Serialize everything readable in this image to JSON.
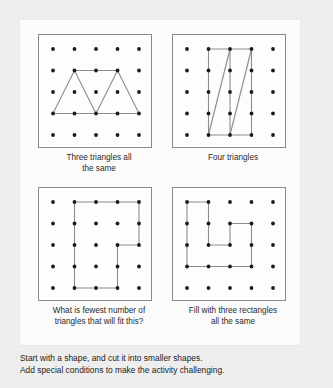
{
  "document": {
    "title": "Geoboard shape activities"
  },
  "grid": {
    "rows": 5,
    "cols": 5,
    "dot_color": "#1b1b1b",
    "line_color": "#8d8d8d",
    "board_border_color": "#8a8a8a"
  },
  "boards": [
    {
      "id": "board-three-triangles",
      "caption": "Three triangles all the same",
      "caption_lines": [
        "Three triangles all",
        "the same"
      ],
      "shape_type": "triangles",
      "polylines": [
        [
          [
            1,
            4
          ],
          [
            2,
            2
          ],
          [
            3,
            4
          ],
          [
            4,
            2
          ],
          [
            5,
            4
          ],
          [
            1,
            4
          ]
        ],
        [
          [
            2,
            2
          ],
          [
            4,
            2
          ]
        ]
      ]
    },
    {
      "id": "board-four-triangles",
      "caption": "Four triangles",
      "caption_lines": [
        "Four triangles"
      ],
      "shape_type": "triangles",
      "polylines": [
        [
          [
            2,
            1
          ],
          [
            4,
            1
          ]
        ],
        [
          [
            2,
            5
          ],
          [
            4,
            5
          ]
        ],
        [
          [
            2,
            1
          ],
          [
            2,
            5
          ]
        ],
        [
          [
            3,
            1
          ],
          [
            3,
            5
          ]
        ],
        [
          [
            4,
            1
          ],
          [
            4,
            5
          ]
        ],
        [
          [
            2,
            5
          ],
          [
            3,
            1
          ]
        ],
        [
          [
            3,
            5
          ],
          [
            4,
            1
          ]
        ]
      ]
    },
    {
      "id": "board-fewest-triangles",
      "caption": "What is fewest number of triangles that will fit this?",
      "caption_lines": [
        "What is fewest number of",
        "triangles that will fit this?"
      ],
      "shape_type": "polygon",
      "polylines": [
        [
          [
            2,
            1
          ],
          [
            5,
            1
          ],
          [
            5,
            3
          ],
          [
            4,
            3
          ],
          [
            4,
            5
          ],
          [
            2,
            5
          ],
          [
            2,
            1
          ]
        ]
      ]
    },
    {
      "id": "board-three-rectangles",
      "caption": "Fill with three rectangles all the same",
      "caption_lines": [
        "Fill with three rectangles",
        "all the same"
      ],
      "shape_type": "polygon",
      "polylines": [
        [
          [
            1,
            1
          ],
          [
            2,
            1
          ],
          [
            2,
            3
          ],
          [
            3,
            3
          ],
          [
            3,
            2
          ],
          [
            4,
            2
          ],
          [
            4,
            4
          ],
          [
            1,
            4
          ],
          [
            1,
            1
          ]
        ]
      ]
    }
  ],
  "footer": {
    "lines": [
      "Start with a shape, and cut it into smaller shapes.",
      "Add special conditions to make the activity challenging."
    ]
  }
}
